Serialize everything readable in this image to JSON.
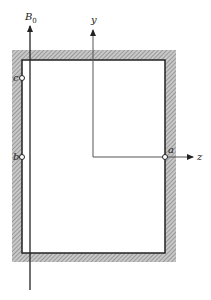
{
  "diagram": {
    "field_label": "B",
    "field_subscript": "0",
    "axes": {
      "y_label": "y",
      "z_label": "z"
    },
    "points": [
      {
        "id": "a",
        "label": "a"
      },
      {
        "id": "b",
        "label": "b"
      },
      {
        "id": "c",
        "label": "c"
      }
    ],
    "colors": {
      "line": "#222222",
      "hatch": "#9a9a9a",
      "background": "#ffffff"
    }
  }
}
